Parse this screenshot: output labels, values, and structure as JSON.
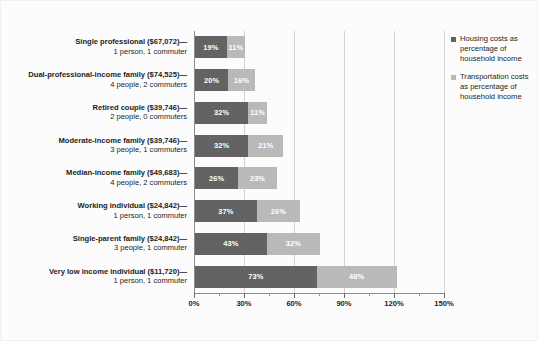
{
  "chart_data": {
    "type": "bar",
    "orientation": "horizontal",
    "stacked": true,
    "title": "",
    "xlabel": "",
    "ylabel": "",
    "xlim": [
      0,
      150
    ],
    "xticks": [
      "0%",
      "30%",
      "60%",
      "90%",
      "120%",
      "150%"
    ],
    "xtick_values": [
      0,
      30,
      60,
      90,
      120,
      150
    ],
    "minor_tick_interval": 15,
    "grid": true,
    "legend_position": "right",
    "categories": [
      "Single professional ($67,072)— 1 person, 1 commuter",
      "Dual-professional-income family ($74,525)— 4 people, 2 commuters",
      "Retired couple ($39,746)— 2 people, 0 commuters",
      "Moderate-income family ($39,746)— 3 people, 1 commuters",
      "Median-income family ($49,683)— 4 people, 2 commuters",
      "Working individual ($24,842)— 1 person, 1 commuter",
      "Single-parent family ($24,842)— 3 people, 1 commuter",
      "Very low income individual ($11,720)— 1 person, 1 commuter"
    ],
    "series": [
      {
        "name": "Housing costs as percentage of household income",
        "color": "#636363",
        "values": [
          19,
          20,
          32,
          32,
          26,
          37,
          43,
          73
        ]
      },
      {
        "name": "Transportation costs as percentage of household income",
        "color": "#b9b9b9",
        "values": [
          11,
          16,
          11,
          21,
          23,
          26,
          32,
          48
        ]
      }
    ]
  },
  "rows": [
    {
      "line1": "Single professional ($67,072)—",
      "line2": "1 person, 1 commuter",
      "housing": 19,
      "transport": 11,
      "housing_label": "19%",
      "transport_label": "11%"
    },
    {
      "line1": "Dual-professional-income family ($74,525)—",
      "line2": "4 people, 2 commuters",
      "housing": 20,
      "transport": 16,
      "housing_label": "20%",
      "transport_label": "16%"
    },
    {
      "line1": "Retired couple ($39,746)—",
      "line2": "2 people, 0 commuters",
      "housing": 32,
      "transport": 11,
      "housing_label": "32%",
      "transport_label": "11%"
    },
    {
      "line1": "Moderate-income family ($39,746)—",
      "line2": "3 people, 1 commuters",
      "housing": 32,
      "transport": 21,
      "housing_label": "32%",
      "transport_label": "21%"
    },
    {
      "line1": "Median-income family ($49,683)—",
      "line2": "4 people, 2 commuters",
      "housing": 26,
      "transport": 23,
      "housing_label": "26%",
      "transport_label": "23%"
    },
    {
      "line1": "Working individual ($24,842)—",
      "line2": "1 person, 1 commuter",
      "housing": 37,
      "transport": 26,
      "housing_label": "37%",
      "transport_label": "26%"
    },
    {
      "line1": "Single-parent family ($24,842)—",
      "line2": "3 people, 1 commuter",
      "housing": 43,
      "transport": 32,
      "housing_label": "43%",
      "transport_label": "32%"
    },
    {
      "line1": "Very low income individual ($11,720)—",
      "line2": "1 person, 1 commuter",
      "housing": 73,
      "transport": 48,
      "housing_label": "73%",
      "transport_label": "48%"
    }
  ],
  "legend": {
    "entries": [
      {
        "label": "Housing costs as percentage of household income",
        "color": "#636363",
        "swatch_class": "housing"
      },
      {
        "label": "Transportation costs as percentage of household income",
        "color": "#b9b9b9",
        "swatch_class": "transport"
      }
    ]
  },
  "axis": {
    "x_tick_labels": [
      "0%",
      "30%",
      "60%",
      "90%",
      "120%",
      "150%"
    ]
  },
  "colors": {
    "housing": "#636363",
    "transport": "#b9b9b9",
    "gridline": "#d2d2d2",
    "axis": "#8c8c8c",
    "background": "#fcfcfc",
    "text": "#1c1c1c"
  }
}
